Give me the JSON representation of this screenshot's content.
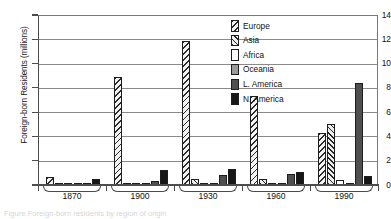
{
  "chart_data": {
    "type": "bar",
    "title": "",
    "xlabel": "",
    "ylabel": "Foreign-born Residents (millions)",
    "categories": [
      "1870",
      "1900",
      "1930",
      "1960",
      "1990"
    ],
    "ylim": [
      0,
      14
    ],
    "yticks": [
      0,
      2,
      4,
      6,
      8,
      10,
      12,
      14
    ],
    "ytick_labels": [
      "0",
      "2",
      "4",
      "6",
      "8",
      "10",
      "12",
      "14"
    ],
    "grid": true,
    "legend_position": "upper right",
    "series": [
      {
        "name": "Europe",
        "pattern": "diagonal-hatch-down",
        "color": "#f2f2f2",
        "values": [
          0.62,
          8.9,
          11.85,
          7.3,
          4.3
        ]
      },
      {
        "name": "Asia",
        "pattern": "diagonal-hatch-up",
        "color": "#ededed",
        "values": [
          0.08,
          0.2,
          0.5,
          0.52,
          5.0
        ]
      },
      {
        "name": "Africa",
        "pattern": "solid-white",
        "color": "#ffffff",
        "values": [
          0.02,
          0.03,
          0.04,
          0.1,
          0.4
        ]
      },
      {
        "name": "Oceania",
        "pattern": "solid-gray",
        "color": "#9a9a9a",
        "values": [
          0.02,
          0.03,
          0.04,
          0.06,
          0.1
        ]
      },
      {
        "name": "L. America",
        "pattern": "solid-dark-gray",
        "color": "#4f4f4f",
        "values": [
          0.1,
          0.3,
          0.85,
          0.9,
          8.4
        ]
      },
      {
        "name": "N. America",
        "pattern": "solid-black",
        "color": "#171717",
        "values": [
          0.5,
          1.2,
          1.3,
          1.05,
          0.78
        ]
      }
    ]
  },
  "axis": {
    "y_title": "Foreign-born Residents (millions)"
  },
  "legend": {
    "items": [
      {
        "label": "Europe"
      },
      {
        "label": "Asia"
      },
      {
        "label": "Africa"
      },
      {
        "label": "Oceania"
      },
      {
        "label": "L. America"
      },
      {
        "label": "N. America"
      }
    ]
  },
  "caption": {
    "text": "Figure    Foreign-born residents by region of origin"
  }
}
